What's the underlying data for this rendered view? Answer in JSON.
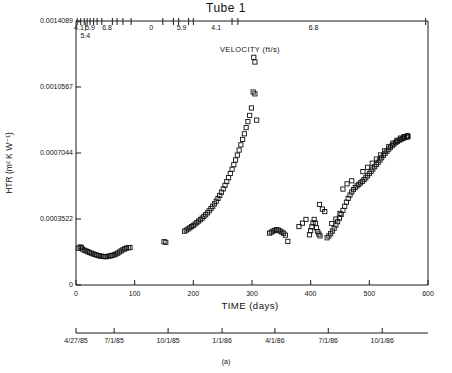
{
  "title": "Tube 1",
  "caption": "(a)",
  "axes": {
    "ylabel": "HTR  (m² K W⁻¹)",
    "xlabel": "TIME (days)",
    "velocity_label": "VELOCITY (ft/s)",
    "ylim": [
      0,
      0.0014089
    ],
    "xlim": [
      0,
      600
    ],
    "ytick_labels": [
      "0",
      "0.0003522",
      "0.0007044",
      "0.0010567",
      "0.0014089"
    ],
    "ytick_values": [
      0,
      0.0003522,
      0.0007044,
      0.0010567,
      0.0014089
    ],
    "xtick_labels": [
      "0",
      "100",
      "200",
      "300",
      "400",
      "500",
      "600"
    ],
    "xtick_values": [
      0,
      100,
      200,
      300,
      400,
      500,
      600
    ],
    "date_ticks": [
      {
        "label": "4/27/85",
        "day": 0
      },
      {
        "label": "7/1/85",
        "day": 65
      },
      {
        "label": "10/1/85",
        "day": 157
      },
      {
        "label": "1/1/86",
        "day": 249
      },
      {
        "label": "4/1/86",
        "day": 339
      },
      {
        "label": "7/1/86",
        "day": 430
      },
      {
        "label": "10/1/86",
        "day": 522
      }
    ],
    "velocity_labels": [
      {
        "label": "4.1",
        "day": 5
      },
      {
        "label": "5.9",
        "day": 24
      },
      {
        "label": "5.4",
        "day": 16
      },
      {
        "label": "6.8",
        "day": 53
      },
      {
        "label": "0",
        "day": 128
      },
      {
        "label": "5.9",
        "day": 180
      },
      {
        "label": "4.1",
        "day": 239
      },
      {
        "label": "6.8",
        "day": 405
      }
    ],
    "velocity_tick_days": [
      2,
      8,
      14,
      19,
      24,
      30,
      36,
      44,
      62,
      70,
      80,
      94,
      148,
      166,
      175,
      192,
      200,
      266,
      276,
      596
    ]
  },
  "chart_data": {
    "type": "scatter",
    "title": "Tube 1",
    "xlabel": "TIME (days)",
    "ylabel": "HTR (m² K W⁻¹)",
    "xlim": [
      0,
      600
    ],
    "ylim": [
      0,
      0.0014089
    ],
    "grid": false,
    "legend": null,
    "marker": "open-square",
    "series": [
      {
        "name": "HTR",
        "points": [
          [
            4,
            0.000196
          ],
          [
            7,
            0.000203
          ],
          [
            9,
            0.0002
          ],
          [
            11,
            0.000192
          ],
          [
            14,
            0.000186
          ],
          [
            17,
            0.000182
          ],
          [
            20,
            0.000178
          ],
          [
            23,
            0.000174
          ],
          [
            26,
            0.00017
          ],
          [
            29,
            0.000166
          ],
          [
            32,
            0.000163
          ],
          [
            35,
            0.00016
          ],
          [
            38,
            0.000157
          ],
          [
            41,
            0.000155
          ],
          [
            44,
            0.000153
          ],
          [
            47,
            0.000152
          ],
          [
            50,
            0.000151
          ],
          [
            53,
            0.000152
          ],
          [
            56,
            0.000154
          ],
          [
            59,
            0.000156
          ],
          [
            62,
            0.000158
          ],
          [
            65,
            0.000161
          ],
          [
            68,
            0.000165
          ],
          [
            71,
            0.00017
          ],
          [
            74,
            0.000176
          ],
          [
            77,
            0.000182
          ],
          [
            80,
            0.000188
          ],
          [
            83,
            0.000193
          ],
          [
            86,
            0.000197
          ],
          [
            89,
            0.000199
          ],
          [
            92,
            0.0002
          ],
          [
            150,
            0.000231
          ],
          [
            153,
            0.000228
          ],
          [
            185,
            0.000287
          ],
          [
            188,
            0.000293
          ],
          [
            191,
            0.000299
          ],
          [
            194,
            0.000305
          ],
          [
            197,
            0.000312
          ],
          [
            200,
            0.000318
          ],
          [
            203,
            0.000325
          ],
          [
            206,
            0.000333
          ],
          [
            209,
            0.000341
          ],
          [
            212,
            0.000349
          ],
          [
            215,
            0.000357
          ],
          [
            218,
            0.000366
          ],
          [
            221,
            0.000375
          ],
          [
            224,
            0.000385
          ],
          [
            227,
            0.000396
          ],
          [
            230,
            0.000408
          ],
          [
            233,
            0.00042
          ],
          [
            236,
            0.000433
          ],
          [
            239,
            0.000447
          ],
          [
            242,
            0.000462
          ],
          [
            245,
            0.000478
          ],
          [
            248,
            0.000495
          ],
          [
            251,
            0.000513
          ],
          [
            254,
            0.000532
          ],
          [
            257,
            0.000552
          ],
          [
            260,
            0.000573
          ],
          [
            263,
            0.000595
          ],
          [
            266,
            0.000618
          ],
          [
            269,
            0.000642
          ],
          [
            272,
            0.000667
          ],
          [
            275,
            0.000693
          ],
          [
            278,
            0.00072
          ],
          [
            281,
            0.000748
          ],
          [
            284,
            0.000777
          ],
          [
            287,
            0.000807
          ],
          [
            290,
            0.00084
          ],
          [
            293,
            0.000872
          ],
          [
            296,
            0.000905
          ],
          [
            299,
            0.000945
          ],
          [
            302,
            0.00103
          ],
          [
            305,
            0.00102
          ],
          [
            303,
            0.001215
          ],
          [
            305,
            0.00119
          ],
          [
            308,
            0.00088
          ],
          [
            330,
            0.000277
          ],
          [
            333,
            0.000282
          ],
          [
            336,
            0.000288
          ],
          [
            339,
            0.000292
          ],
          [
            342,
            0.000295
          ],
          [
            345,
            0.000293
          ],
          [
            348,
            0.000288
          ],
          [
            351,
            0.000282
          ],
          [
            354,
            0.000276
          ],
          [
            357,
            0.000266
          ],
          [
            361,
            0.000233
          ],
          [
            398,
            0.000268
          ],
          [
            400,
            0.00029
          ],
          [
            402,
            0.00031
          ],
          [
            404,
            0.000332
          ],
          [
            406,
            0.00035
          ],
          [
            408,
            0.00033
          ],
          [
            410,
            0.000305
          ],
          [
            412,
            0.000285
          ],
          [
            414,
            0.000272
          ],
          [
            416,
            0.000262
          ],
          [
            428,
            0.000252
          ],
          [
            431,
            0.000262
          ],
          [
            434,
            0.000274
          ],
          [
            437,
            0.000288
          ],
          [
            440,
            0.000303
          ],
          [
            443,
            0.00032
          ],
          [
            446,
            0.000338
          ],
          [
            449,
            0.000357
          ],
          [
            452,
            0.000377
          ],
          [
            455,
            0.000398
          ],
          [
            458,
            0.00042
          ],
          [
            461,
            0.000442
          ],
          [
            464,
            0.000462
          ],
          [
            467,
            0.00048
          ],
          [
            470,
            0.000496
          ],
          [
            473,
            0.000509
          ],
          [
            476,
            0.00052
          ],
          [
            479,
            0.000529
          ],
          [
            482,
            0.000537
          ],
          [
            485,
            0.000545
          ],
          [
            488,
            0.000553
          ],
          [
            491,
            0.000562
          ],
          [
            494,
            0.000572
          ],
          [
            497,
            0.000583
          ],
          [
            500,
            0.000595
          ],
          [
            503,
            0.000607
          ],
          [
            506,
            0.000619
          ],
          [
            509,
            0.000631
          ],
          [
            512,
            0.000643
          ],
          [
            515,
            0.000655
          ],
          [
            518,
            0.000667
          ],
          [
            521,
            0.000679
          ],
          [
            524,
            0.000691
          ],
          [
            527,
            0.000703
          ],
          [
            530,
            0.000714
          ],
          [
            533,
            0.000725
          ],
          [
            536,
            0.000735
          ],
          [
            539,
            0.000744
          ],
          [
            542,
            0.000752
          ],
          [
            545,
            0.00076
          ],
          [
            548,
            0.000767
          ],
          [
            551,
            0.000773
          ],
          [
            554,
            0.000778
          ],
          [
            557,
            0.000782
          ],
          [
            560,
            0.000786
          ],
          [
            563,
            0.000789
          ],
          [
            566,
            0.000791
          ],
          [
            415,
            0.00043
          ],
          [
            420,
            0.000405
          ],
          [
            424,
            0.000392
          ],
          [
            455,
            0.000512
          ],
          [
            462,
            0.00054
          ],
          [
            470,
            0.000556
          ],
          [
            489,
            0.000605
          ],
          [
            497,
            0.000628
          ],
          [
            505,
            0.00065
          ],
          [
            512,
            0.000672
          ],
          [
            519,
            0.000694
          ],
          [
            526,
            0.000716
          ],
          [
            533,
            0.000738
          ],
          [
            540,
            0.000757
          ],
          [
            547,
            0.000772
          ],
          [
            553,
            0.000784
          ],
          [
            559,
            0.000792
          ],
          [
            565,
            0.000797
          ],
          [
            380,
            0.000312
          ],
          [
            386,
            0.00033
          ],
          [
            392,
            0.00035
          ],
          [
            436,
            0.000328
          ],
          [
            443,
            0.000352
          ],
          [
            450,
            0.000382
          ]
        ]
      }
    ]
  }
}
